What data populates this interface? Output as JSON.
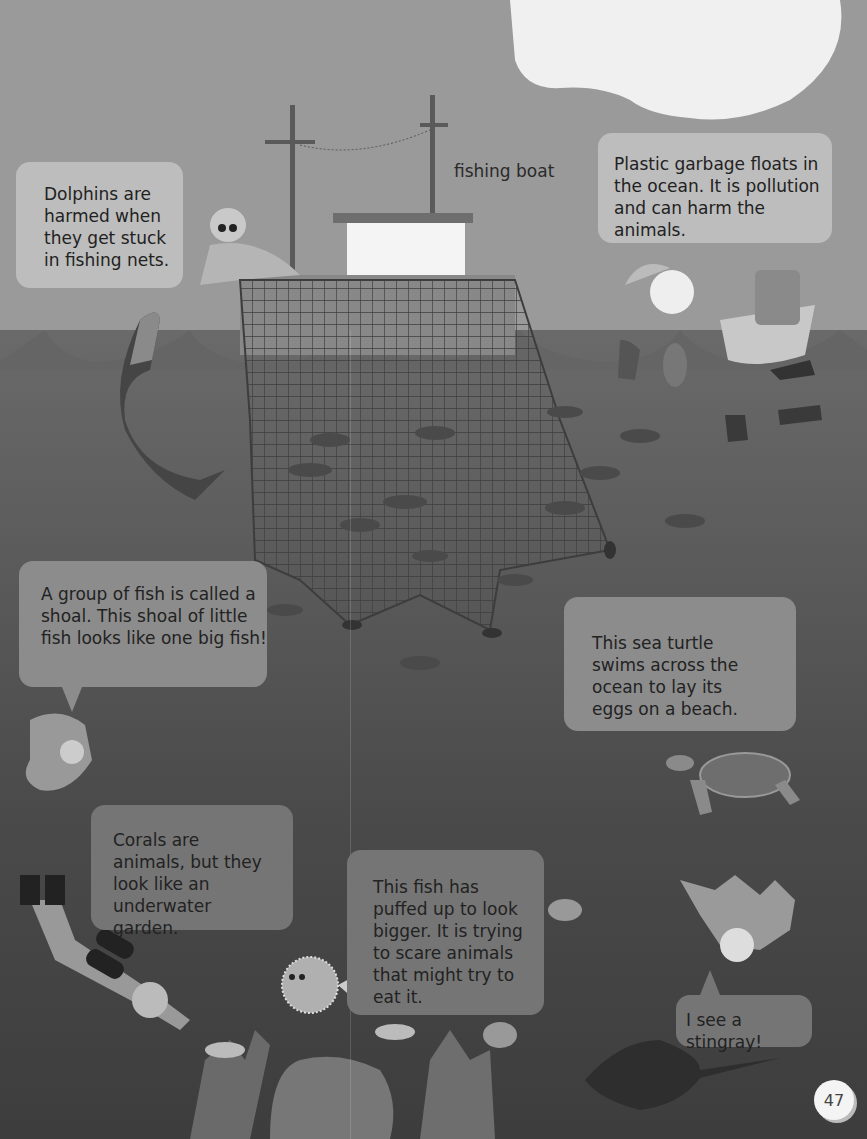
{
  "page": {
    "number": "47",
    "scene": "ocean with fishing boat, net, divers and sea animals"
  },
  "labels": {
    "fishing_boat": "fishing boat"
  },
  "bubbles": {
    "dolphins": "Dolphins are harmed when they get stuck in fishing nets.",
    "plastic": "Plastic garbage floats in the ocean. It is pollution and can harm the animals.",
    "shoal": "A group of fish is called a shoal. This shoal of little fish looks like one big fish!",
    "turtle": "This sea turtle swims across the ocean to lay its eggs on a beach.",
    "corals": "Corals are animals, but they look like an underwater garden.",
    "pufferfish": "This fish has puffed up to look bigger. It is trying to scare animals that might try to eat it.",
    "stingray": "I see a stingray!"
  },
  "illustrations": [
    "cloud-icon",
    "fishing-boat-icon",
    "fisherman-icon",
    "dolphin-icon",
    "fishing-net-icon",
    "child-in-boat-icon",
    "plastic-bottle-icon",
    "plastic-bag-icon",
    "fish-icon",
    "sea-turtle-icon",
    "diver-icon",
    "pufferfish-icon",
    "jellyfish-icon",
    "coral-icon",
    "stingray-icon",
    "swimming-child-icon"
  ],
  "colors": {
    "sky": "#9a9a9a",
    "sea": "#5a5a5a",
    "bubble_light": "#bdbdbd",
    "bubble_mid": "#8c8c8c",
    "text": "#222222"
  }
}
